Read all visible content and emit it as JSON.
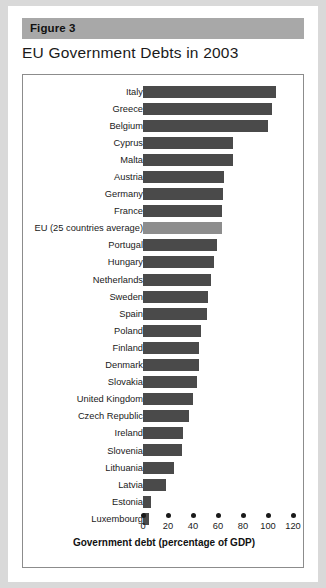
{
  "figure": {
    "band_label": "Figure 3",
    "title": "EU Government Debts in 2003"
  },
  "chart_data": {
    "type": "bar",
    "orientation": "horizontal",
    "title": "EU Government Debts in 2003",
    "xlabel": "Government debt (percentage of GDP)",
    "ylabel": "",
    "xlim": [
      0,
      120
    ],
    "xticks": [
      0,
      20,
      40,
      60,
      80,
      100,
      120
    ],
    "grid": false,
    "legend": "none",
    "bar_color": "#4a4a4a",
    "highlight_color": "#8d8d8d",
    "categories": [
      "Italy",
      "Greece",
      "Belgium",
      "Cyprus",
      "Malta",
      "Austria",
      "Germany",
      "France",
      "EU (25 countries average)",
      "Portugal",
      "Hungary",
      "Netherlands",
      "Sweden",
      "Spain",
      "Poland",
      "Finland",
      "Denmark",
      "Slovakia",
      "United Kingdom",
      "Czech Republic",
      "Ireland",
      "Slovenia",
      "Lithuania",
      "Latvia",
      "Estonia",
      "Luxembourg"
    ],
    "values": [
      106,
      103,
      100,
      72,
      72,
      65,
      64,
      63,
      63,
      59,
      57,
      54,
      52,
      51,
      46,
      45,
      45,
      43,
      40,
      37,
      32,
      31,
      25,
      18,
      6,
      5
    ],
    "highlight_category": "EU (25 countries average)"
  }
}
